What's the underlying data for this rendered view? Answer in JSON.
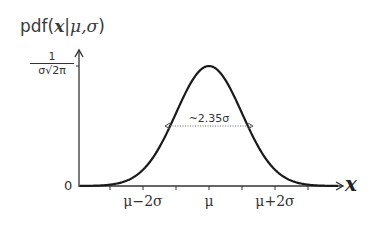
{
  "figure": {
    "y_axis_label": {
      "prefix": "pdf(",
      "var": "x",
      "sep": "|",
      "params": "μ,σ",
      "suffix": ")"
    },
    "y_peak_label": {
      "numerator": "1",
      "denominator": "σ√2π"
    },
    "y_zero_label": "0",
    "x_axis_label": "x",
    "fwhm_annotation": "~2.35σ",
    "x_tick_labels": [
      {
        "text": "μ−2σ",
        "x": 143
      },
      {
        "text": "μ",
        "x": 209
      },
      {
        "text": "μ+2σ",
        "x": 275
      }
    ],
    "colors": {
      "curve": "#1a1a1a",
      "axes": "#333333",
      "dotted": "#777777"
    }
  },
  "chart_data": {
    "type": "line",
    "title": "pdf(x|μ,σ)",
    "xlabel": "x",
    "ylabel": "pdf(x|μ,σ)",
    "series": [
      {
        "name": "Normal distribution pdf",
        "function": "gaussian(μ, σ)"
      }
    ],
    "x_ticks": [
      "μ−3σ",
      "μ−2σ",
      "μ−σ",
      "μ",
      "μ+σ",
      "μ+2σ",
      "μ+3σ"
    ],
    "x_tick_labels_shown": [
      "μ−2σ",
      "μ",
      "μ+2σ"
    ],
    "y_ticks": [
      "0",
      "1/(σ√2π)"
    ],
    "annotations": [
      "~2.35σ (FWHM)"
    ],
    "grid": false
  }
}
